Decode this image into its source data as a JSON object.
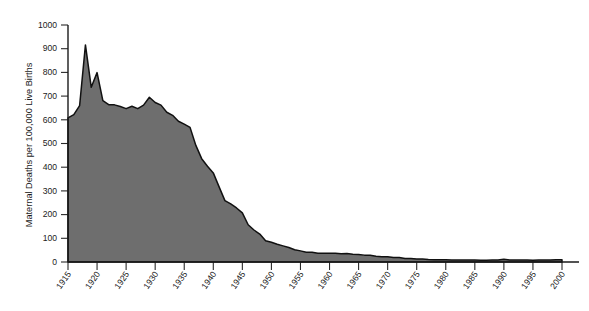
{
  "chart_data": {
    "type": "area",
    "title": "",
    "xlabel": "",
    "ylabel": "Maternal Deaths per 100,000 Live Births",
    "xlim": [
      1915,
      2000
    ],
    "ylim": [
      0,
      1000
    ],
    "grid": false,
    "legend": null,
    "fill_color": "#6e6e6e",
    "line_color": "#111111",
    "background_color": "#ffffff",
    "ytick_labels": [
      "0",
      "100",
      "200",
      "300",
      "400",
      "500",
      "600",
      "700",
      "800",
      "900",
      "1000"
    ],
    "ytick_values": [
      0,
      100,
      200,
      300,
      400,
      500,
      600,
      700,
      800,
      900,
      1000
    ],
    "xtick_labels": [
      "1915",
      "1920",
      "1925",
      "1930",
      "1935",
      "1940",
      "1945",
      "1950",
      "1955",
      "1960",
      "1965",
      "1970",
      "1975",
      "1980",
      "1985",
      "1990",
      "1995",
      "2000"
    ],
    "xtick_values": [
      1915,
      1920,
      1925,
      1930,
      1935,
      1940,
      1945,
      1950,
      1955,
      1960,
      1965,
      1970,
      1975,
      1980,
      1985,
      1990,
      1995,
      2000
    ],
    "x": [
      1915,
      1916,
      1917,
      1918,
      1919,
      1920,
      1921,
      1922,
      1923,
      1924,
      1925,
      1926,
      1927,
      1928,
      1929,
      1930,
      1931,
      1932,
      1933,
      1934,
      1935,
      1936,
      1937,
      1938,
      1939,
      1940,
      1941,
      1942,
      1943,
      1944,
      1945,
      1946,
      1947,
      1948,
      1949,
      1950,
      1951,
      1952,
      1953,
      1954,
      1955,
      1956,
      1957,
      1958,
      1959,
      1960,
      1961,
      1962,
      1963,
      1964,
      1965,
      1966,
      1967,
      1968,
      1969,
      1970,
      1971,
      1972,
      1973,
      1974,
      1975,
      1976,
      1977,
      1978,
      1979,
      1980,
      1981,
      1982,
      1983,
      1984,
      1985,
      1986,
      1987,
      1988,
      1989,
      1990,
      1991,
      1992,
      1993,
      1994,
      1995,
      1996,
      1997,
      1998,
      1999,
      2000
    ],
    "values": [
      608,
      622,
      660,
      916,
      737,
      799,
      681,
      664,
      663,
      656,
      647,
      657,
      647,
      662,
      695,
      673,
      662,
      632,
      619,
      594,
      582,
      568,
      492,
      436,
      404,
      376,
      317,
      259,
      245,
      228,
      207,
      157,
      135,
      118,
      90,
      83,
      75,
      68,
      61,
      52,
      47,
      41,
      41,
      37,
      37,
      37,
      37,
      35,
      36,
      33,
      32,
      29,
      28,
      24,
      22,
      22,
      19,
      19,
      15,
      15,
      13,
      13,
      11,
      10,
      9,
      9,
      8,
      8,
      8,
      8,
      8,
      7,
      7,
      8,
      8,
      12,
      8,
      8,
      8,
      8,
      7,
      8,
      8,
      8,
      10,
      10
    ],
    "annotations": []
  },
  "axis": {
    "ylabel": "Maternal Deaths per 100,000 Live Births"
  }
}
